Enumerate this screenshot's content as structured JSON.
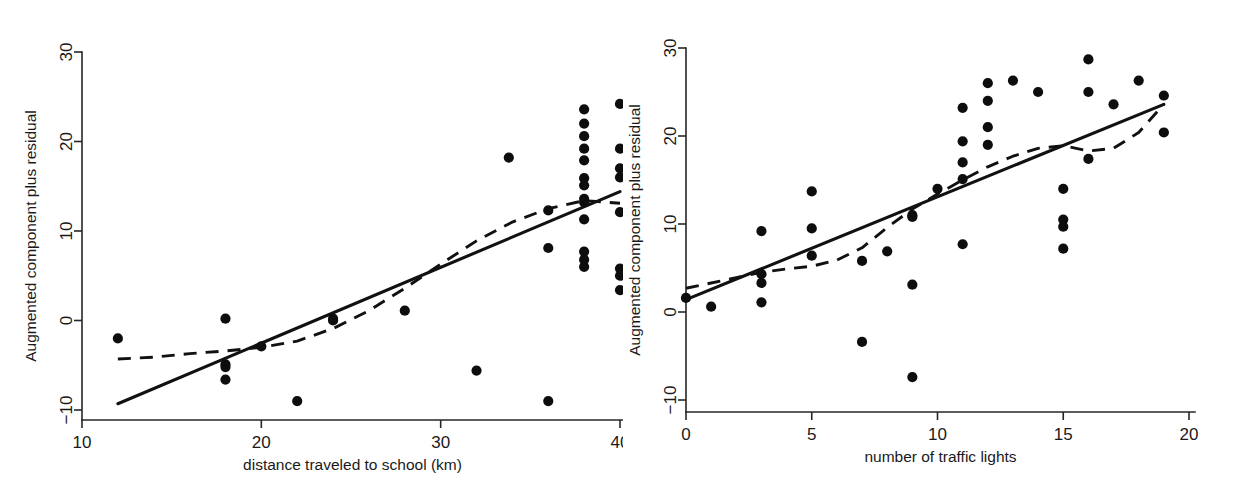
{
  "figure": {
    "background_color": "#ffffff",
    "point_color": "#0d0d0d",
    "line_color": "#111111",
    "panel_count": 2
  },
  "panels": [
    {
      "id": "left",
      "ylabel": "Augmented component plus residual",
      "xlabel": "distance traveled to school (km)",
      "xticks": [
        "10",
        "20",
        "30",
        "40"
      ],
      "yticks": [
        "30",
        "20",
        "10",
        "0",
        "-10"
      ]
    },
    {
      "id": "right",
      "ylabel": "Augmented component plus residual",
      "xlabel": "number of traffic lights",
      "xticks": [
        "0",
        "5",
        "10",
        "15",
        "20"
      ],
      "yticks": [
        "30",
        "20",
        "10",
        "0",
        "-10"
      ]
    }
  ],
  "chart_data": [
    {
      "type": "scatter",
      "title": "",
      "panel": "left",
      "xlabel": "distance traveled to school (km)",
      "ylabel": "Augmented component plus residual",
      "xlim": [
        10,
        40
      ],
      "ylim": [
        -10,
        30
      ],
      "xticks": [
        10,
        20,
        30,
        40
      ],
      "yticks": [
        -10,
        0,
        10,
        20,
        30
      ],
      "grid": false,
      "legend": "none",
      "series": [
        {
          "name": "observations",
          "marker": "filled-circle",
          "x": [
            12,
            18,
            18,
            18,
            18,
            20,
            22,
            24,
            24,
            28,
            32,
            33.8,
            36,
            36,
            36,
            38,
            38,
            38,
            38,
            38,
            38,
            38,
            38,
            38,
            38,
            38,
            38,
            38,
            40,
            40,
            40,
            40,
            40,
            40,
            40,
            40
          ],
          "y": [
            -2.0,
            0.2,
            -4.9,
            -5.2,
            -6.6,
            -2.9,
            -9.0,
            0.2,
            0.0,
            1.1,
            -5.6,
            18.2,
            12.3,
            8.1,
            -9.0,
            23.6,
            22.0,
            20.6,
            19.2,
            17.9,
            15.9,
            15.1,
            13.6,
            13.2,
            11.3,
            7.7,
            6.8,
            6.0,
            24.2,
            19.2,
            17.0,
            16.0,
            12.1,
            5.8,
            5.0,
            3.4
          ]
        }
      ],
      "fit_line": {
        "name": "linear fit",
        "style": "solid",
        "x": [
          12.0,
          40.0
        ],
        "y": [
          -9.3,
          14.4
        ]
      },
      "lowess_line": {
        "name": "lowess smooth",
        "style": "dashed",
        "x": [
          12.0,
          14.0,
          16.0,
          18.0,
          20.0,
          22.0,
          24.0,
          26.0,
          28.0,
          30.0,
          32.0,
          34.0,
          36.0,
          38.0,
          40.0
        ],
        "y": [
          -4.3,
          -4.1,
          -3.7,
          -3.4,
          -3.0,
          -2.3,
          -0.9,
          1.1,
          3.6,
          6.3,
          8.9,
          11.0,
          12.5,
          13.4,
          13.1
        ]
      }
    },
    {
      "type": "scatter",
      "title": "",
      "panel": "right",
      "xlabel": "number of traffic lights",
      "ylabel": "Augmented component plus residual",
      "xlim": [
        0,
        20
      ],
      "ylim": [
        -10,
        30
      ],
      "xticks": [
        0,
        5,
        10,
        15,
        20
      ],
      "yticks": [
        -10,
        0,
        10,
        20,
        30
      ],
      "grid": false,
      "legend": "none",
      "series": [
        {
          "name": "observations",
          "marker": "filled-circle",
          "x": [
            0,
            1,
            3,
            3,
            3,
            3,
            5,
            5,
            5,
            7,
            7,
            8,
            9,
            9,
            9,
            9,
            10,
            11,
            11,
            11,
            11,
            11,
            12,
            12,
            12,
            12,
            13,
            14,
            15,
            15,
            15,
            15,
            16,
            16,
            16,
            17,
            18,
            19,
            19
          ],
          "y": [
            1.6,
            0.6,
            9.2,
            4.3,
            3.3,
            1.1,
            13.7,
            9.5,
            6.4,
            5.8,
            -3.4,
            6.9,
            11.0,
            10.8,
            3.1,
            -7.4,
            14.0,
            23.2,
            19.4,
            17.0,
            15.1,
            7.7,
            26.0,
            24.0,
            21.0,
            19.0,
            26.3,
            25.0,
            14.0,
            10.5,
            9.7,
            7.2,
            28.7,
            25.0,
            17.4,
            23.6,
            26.3,
            24.6,
            20.4
          ]
        }
      ],
      "fit_line": {
        "name": "linear fit",
        "style": "solid",
        "x": [
          0.0,
          19.0
        ],
        "y": [
          1.4,
          23.6
        ]
      },
      "lowess_line": {
        "name": "lowess smooth",
        "style": "dashed",
        "x": [
          0.0,
          1.0,
          2.0,
          3.0,
          4.0,
          5.0,
          6.0,
          7.0,
          8.0,
          9.0,
          10.0,
          11.0,
          12.0,
          13.0,
          14.0,
          15.0,
          16.0,
          17.0,
          18.0,
          19.0
        ],
        "y": [
          2.7,
          3.3,
          3.9,
          4.5,
          4.9,
          5.2,
          5.9,
          7.3,
          9.6,
          11.7,
          13.4,
          15.0,
          16.5,
          17.7,
          18.6,
          18.9,
          18.3,
          18.6,
          20.4,
          23.6
        ]
      }
    }
  ]
}
